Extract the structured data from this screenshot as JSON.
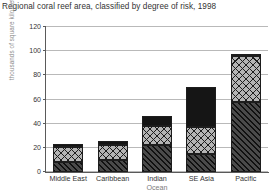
{
  "chart_data": {
    "type": "bar",
    "subtype": "stacked-bar",
    "title": "Regional coral reef area, classified by degree of risk, 1998",
    "xlabel": "",
    "ylabel": "thousands of square kilometres",
    "ylim": [
      0,
      120
    ],
    "yticks": [
      0,
      20,
      40,
      60,
      80,
      100,
      120
    ],
    "ytick_labels": [
      "0",
      "20",
      "40",
      "60",
      "80",
      "100",
      "120"
    ],
    "grid": true,
    "legend": null,
    "categories": [
      "Middle East",
      "Caribbean",
      "Indian Ocean",
      "SE Asia",
      "Pacific"
    ],
    "category_lines": [
      [
        "Middle East",
        ""
      ],
      [
        "Caribbean",
        ""
      ],
      [
        "Indian",
        "Ocean"
      ],
      [
        "SE Asia",
        ""
      ],
      [
        "Pacific",
        ""
      ]
    ],
    "series": [
      {
        "name": "low risk",
        "pattern": "diagonal-hatch",
        "color": "#4a4a4a",
        "values": [
          8,
          10,
          22,
          15,
          58
        ]
      },
      {
        "name": "medium risk",
        "pattern": "cross-hatch",
        "color": "#b4b4b4",
        "values": [
          13,
          12,
          16,
          22,
          38
        ]
      },
      {
        "name": "high risk",
        "pattern": "solid-black",
        "color": "#151515",
        "values": [
          2,
          4,
          8,
          33,
          2
        ]
      }
    ],
    "totals": [
      23,
      26,
      46,
      70,
      98
    ]
  }
}
